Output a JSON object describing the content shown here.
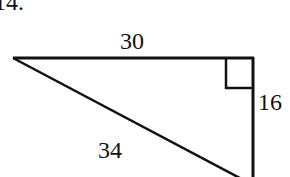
{
  "problem": {
    "number_label": "14."
  },
  "triangle": {
    "type": "right-triangle",
    "side_labels": {
      "top": "30",
      "right": "16",
      "hypotenuse": "34"
    },
    "right_angle_marker": "top-right",
    "stroke_color": "#111111"
  }
}
